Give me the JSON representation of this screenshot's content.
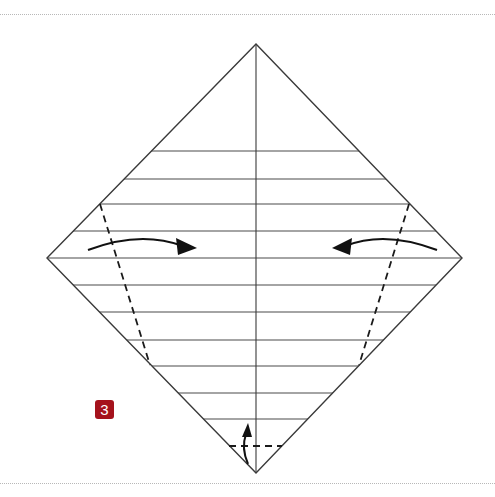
{
  "diagram": {
    "step_number": "3",
    "colors": {
      "line": "#4a4a4a",
      "fold_line": "#1a1a1a",
      "arrow": "#111111",
      "badge": "#a5121c",
      "rule": "#b8b8b8"
    },
    "paper": {
      "shape": "diamond",
      "top": [
        256,
        44
      ],
      "right": [
        462,
        258
      ],
      "bottom": [
        256,
        473
      ],
      "left": [
        47,
        258
      ],
      "center_crease_x": 256
    },
    "horizontal_pleat_lines_y": [
      151,
      179,
      204,
      231,
      258,
      285,
      312,
      340,
      366,
      393,
      419
    ],
    "valley_folds": [
      {
        "name": "left-valley-fold",
        "from": [
          100,
          204
        ],
        "to": [
          150,
          365
        ]
      },
      {
        "name": "right-valley-fold",
        "from": [
          409,
          204
        ],
        "to": [
          359,
          365
        ]
      },
      {
        "name": "bottom-valley-fold",
        "from": [
          229,
          446
        ],
        "to": [
          282,
          446
        ]
      }
    ],
    "arrows": [
      {
        "name": "fold-right-arrow",
        "direction": "right"
      },
      {
        "name": "fold-left-arrow",
        "direction": "left"
      },
      {
        "name": "fold-up-arrow",
        "direction": "up"
      }
    ]
  }
}
